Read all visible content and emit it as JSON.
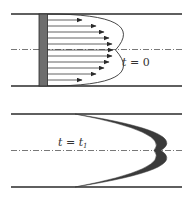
{
  "figure": {
    "colors": {
      "wall": "#2a2a2a",
      "dye_slab": "#6e6e6e",
      "arrow": "#3a3a3a",
      "centerline": "#555555",
      "deformed_dye": "#3a3a3a"
    },
    "panels": [
      {
        "id": "top",
        "label_var": "t",
        "label_eq": " = ",
        "label_val": "0",
        "label_sub": "",
        "arrow_count": 11
      },
      {
        "id": "bottom",
        "label_var": "t",
        "label_eq": " = ",
        "label_val": "t",
        "label_sub": "1"
      }
    ]
  }
}
